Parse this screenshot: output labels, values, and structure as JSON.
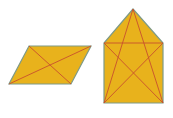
{
  "figure": {
    "width": 173,
    "height": 118,
    "fill_color": "#E8B21C",
    "edge_color": "#7E9A86",
    "line_color": "#C8502E"
  },
  "shapes": [
    {
      "name": "parallelogram",
      "vertices": [
        [
          29,
          46
        ],
        [
          91,
          46
        ],
        [
          71,
          84
        ],
        [
          9,
          84
        ]
      ],
      "diagonals": [
        [
          [
            29,
            46
          ],
          [
            71,
            84
          ]
        ],
        [
          [
            91,
            46
          ],
          [
            9,
            84
          ]
        ]
      ]
    },
    {
      "name": "house-pentagon",
      "vertices": [
        [
          133,
          9
        ],
        [
          163,
          43
        ],
        [
          163,
          103
        ],
        [
          104,
          103
        ],
        [
          104,
          43
        ]
      ],
      "inner_lines": [
        [
          [
            104,
            43
          ],
          [
            163,
            43
          ]
        ],
        [
          [
            133,
            9
          ],
          [
            104,
            103
          ]
        ],
        [
          [
            133,
            9
          ],
          [
            163,
            103
          ]
        ],
        [
          [
            104,
            43
          ],
          [
            163,
            103
          ]
        ],
        [
          [
            163,
            43
          ],
          [
            104,
            103
          ]
        ]
      ]
    }
  ]
}
